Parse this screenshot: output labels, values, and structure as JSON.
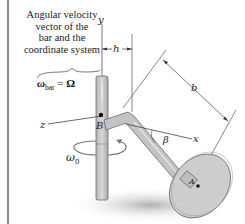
{
  "figure": {
    "caption_lines": [
      "Angular velocity",
      "vector of the",
      "bar and the",
      "coordinate system"
    ],
    "equation": {
      "lhs_symbol": "ω",
      "lhs_subscript": "bar",
      "equals": " = ",
      "rhs_symbol": "Ω"
    },
    "axis_labels": {
      "y": "y",
      "z": "z",
      "x": "x"
    },
    "point_labels": {
      "B": "B",
      "A": "A"
    },
    "dimension_labels": {
      "h": "h",
      "b": "b"
    },
    "angle_label": "β",
    "shaft_rotation": {
      "symbol": "ω",
      "subscript": "0"
    },
    "colors": {
      "shaft": "#c8c8c8",
      "shaft_edge": "#6a6a6a",
      "disk": "#cfcfcf",
      "shadow": "#bdbdbd",
      "line": "#555555",
      "border": "#8a8a8a"
    }
  }
}
